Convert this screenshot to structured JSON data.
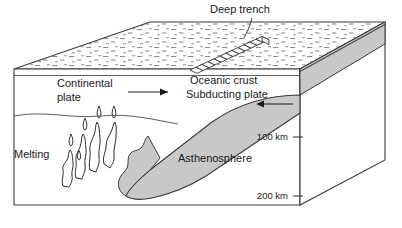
{
  "figure": {
    "labels": {
      "deep_trench": "Deep trench",
      "continental_plate_line1": "Continental",
      "continental_plate_line2": "plate",
      "oceanic_crust": "Oceanic crust",
      "subducting_plate": "Subducting plate",
      "asthenosphere": "Asthenosphere",
      "melting": "Melting",
      "depth_100": "100 km",
      "depth_200": "200 km"
    },
    "colors": {
      "slab_fill": "#c8c8c8",
      "slab_stroke": "#3a3a3a",
      "block_stroke": "#3a3a3a",
      "side_face_fill": "#ffffff",
      "top_surface_fill": "#ffffff",
      "stipple": "#7a7a7a",
      "text": "#1a1a1a",
      "background": "#ffffff"
    },
    "arrows": {
      "continental_direction": "right",
      "subducting_direction": "left"
    },
    "icons": {
      "trench": "trench-ladder-icon",
      "melting": "magma-plume-icon",
      "water": "water-stipple-icon"
    }
  }
}
